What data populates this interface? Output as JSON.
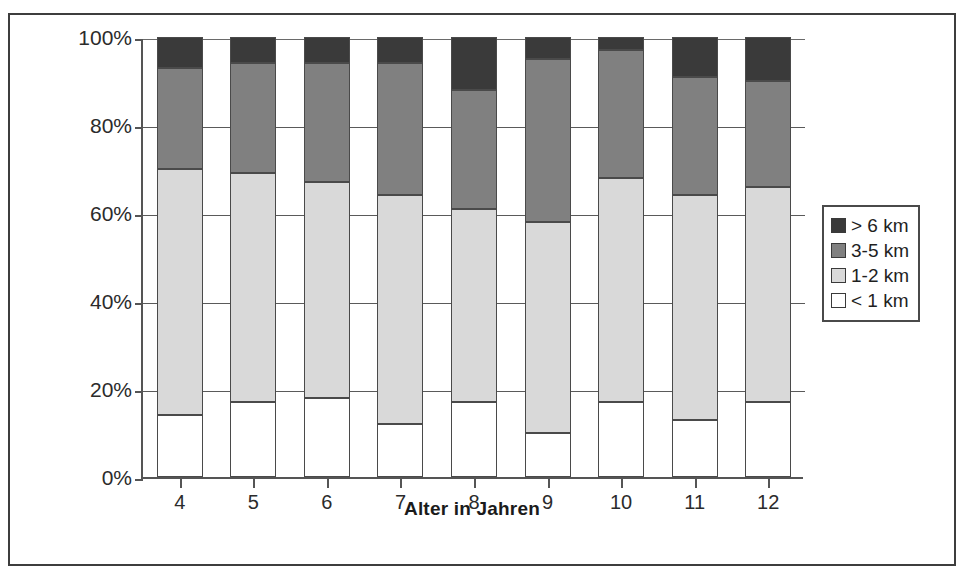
{
  "chart_data": {
    "type": "bar",
    "subtype": "stacked-percentage-column",
    "title": "",
    "xlabel": "Alter in Jahren",
    "ylabel": "",
    "categories": [
      "4",
      "5",
      "6",
      "7",
      "8",
      "9",
      "10",
      "11",
      "12"
    ],
    "ylim": [
      0,
      100
    ],
    "ytick_labels": [
      "0%",
      "20%",
      "40%",
      "60%",
      "80%",
      "100%"
    ],
    "ytick_values": [
      0,
      20,
      40,
      60,
      80,
      100
    ],
    "grid": true,
    "legend_position": "right",
    "stack_order_bottom_to_top": [
      "< 1 km",
      "1-2 km",
      "3-5 km",
      "> 6 km"
    ],
    "series": [
      {
        "name": "< 1 km",
        "color": "#ffffff",
        "values": [
          14,
          17,
          18,
          12,
          17,
          10,
          17,
          13,
          17
        ]
      },
      {
        "name": "1-2 km",
        "color": "#d9d9d9",
        "values": [
          56,
          52,
          49,
          52,
          44,
          48,
          51,
          51,
          49
        ]
      },
      {
        "name": "3-5 km",
        "color": "#808080",
        "values": [
          23,
          25,
          27,
          30,
          27,
          37,
          29,
          27,
          24
        ]
      },
      {
        "name": "> 6 km",
        "color": "#3a3a3a",
        "values": [
          7,
          6,
          6,
          6,
          12,
          5,
          3,
          9,
          10
        ]
      }
    ],
    "cumulative_tops": [
      [
        14,
        70,
        93,
        100
      ],
      [
        17,
        69,
        94,
        100
      ],
      [
        18,
        67,
        94,
        100
      ],
      [
        12,
        64,
        94,
        100
      ],
      [
        17,
        61,
        88,
        100
      ],
      [
        10,
        58,
        95,
        100
      ],
      [
        17,
        68,
        97,
        100
      ],
      [
        13,
        64,
        91,
        100
      ],
      [
        17,
        66,
        90,
        100
      ]
    ]
  },
  "legend": {
    "items": [
      {
        "label": "> 6 km",
        "color": "#3a3a3a"
      },
      {
        "label": "3-5 km",
        "color": "#808080"
      },
      {
        "label": "1-2 km",
        "color": "#d9d9d9"
      },
      {
        "label": "< 1 km",
        "color": "#ffffff"
      }
    ]
  },
  "axes": {
    "y_labels": [
      "100%",
      "80%",
      "60%",
      "40%",
      "20%",
      "0%"
    ],
    "x_labels": [
      "4",
      "5",
      "6",
      "7",
      "8",
      "9",
      "10",
      "11",
      "12"
    ],
    "x_title": "Alter in Jahren"
  },
  "colors": {
    "frame": "#3d3d3d",
    "axis": "#555555",
    "grid": "#5a5a5a",
    "bar_border": "#4a4a4a",
    "text": "#2b2b2b",
    "background": "#ffffff"
  }
}
